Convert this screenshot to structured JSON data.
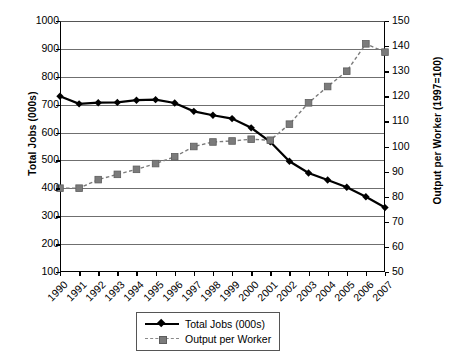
{
  "chart_data": {
    "type": "line",
    "title": "",
    "xlabel": "",
    "ylabel": "Total Jobs (000s)",
    "y2label": "Output per Worker (1997=100)",
    "grid": true,
    "legend_position": "bottom-center",
    "categories": [
      "1990",
      "1991",
      "1992",
      "1993",
      "1994",
      "1995",
      "1996",
      "1997",
      "1998",
      "1999",
      "2000",
      "2001",
      "2002",
      "2003",
      "2004",
      "2005",
      "2006",
      "2007"
    ],
    "yticks": [
      "100",
      "200",
      "300",
      "400",
      "500",
      "600",
      "700",
      "800",
      "900",
      "1000"
    ],
    "ylim": [
      100,
      1000
    ],
    "y2ticks": [
      "50",
      "60",
      "70",
      "80",
      "90",
      "100",
      "110",
      "120",
      "130",
      "140",
      "150"
    ],
    "y2lim": [
      50,
      150
    ],
    "series": [
      {
        "name": "Total Jobs (000s)",
        "axis": "left",
        "color": "#000000",
        "marker": "diamond",
        "linestyle": "solid",
        "values": [
          730,
          703,
          707,
          708,
          716,
          718,
          706,
          676,
          662,
          650,
          617,
          567,
          497,
          455,
          430,
          404,
          370,
          331
        ]
      },
      {
        "name": "Output per Worker",
        "axis": "right",
        "color": "#7b7b7b",
        "marker": "square",
        "linestyle": "dashed",
        "values": [
          83.4,
          83.4,
          86.8,
          88.9,
          90.9,
          93.2,
          95.9,
          100.0,
          101.8,
          102.2,
          102.9,
          102.5,
          108.9,
          117.4,
          123.9,
          130.0,
          140.9,
          137.6
        ]
      }
    ]
  },
  "legend": {
    "items": [
      {
        "label": "Total Jobs (000s)"
      },
      {
        "label": "Output per Worker"
      }
    ]
  }
}
